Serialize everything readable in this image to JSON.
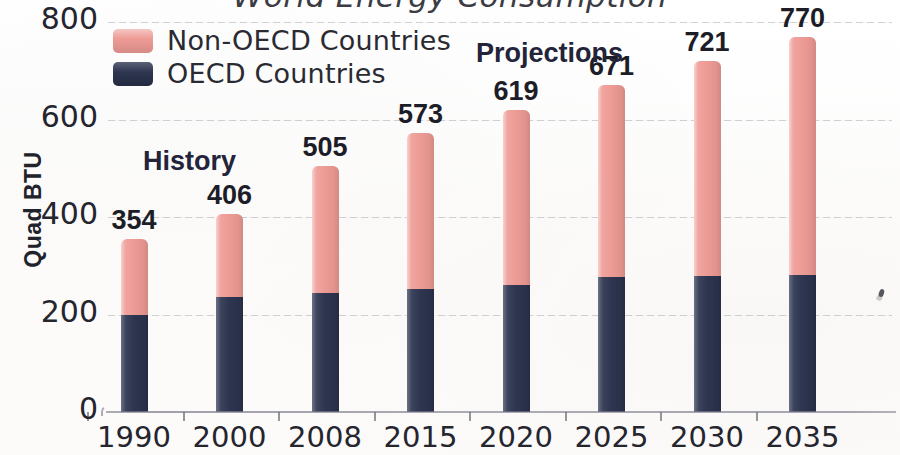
{
  "chart_data": {
    "type": "bar",
    "subtype": "stacked",
    "title": "World Energy Consumption",
    "xlabel": "",
    "ylabel": "Quad BTU",
    "categories": [
      "1990",
      "2000",
      "2008",
      "2015",
      "2020",
      "2025",
      "2030",
      "2035"
    ],
    "series": [
      {
        "name": "OECD Countries",
        "color": "#2d3550",
        "values": [
          198,
          236,
          244,
          252,
          261,
          276,
          280,
          281
        ]
      },
      {
        "name": "Non-OECD Countries",
        "color": "#ee9b95",
        "values": [
          156,
          170,
          261,
          321,
          358,
          395,
          441,
          489
        ]
      }
    ],
    "totals": [
      354,
      406,
      505,
      573,
      619,
      671,
      721,
      770
    ],
    "total_labels": [
      "354",
      "406",
      "505",
      "573",
      "619",
      "671",
      "721",
      "770"
    ],
    "ylim": [
      0,
      800
    ],
    "yticks": [
      0,
      200,
      400,
      600,
      800
    ],
    "ytick_labels": [
      "0",
      "200",
      "400",
      "600",
      "800"
    ],
    "grid": true,
    "legend_position": "top-left",
    "annotations": [
      {
        "text": "History",
        "x_category": "1990"
      },
      {
        "text": "Projections",
        "x_category": "2020"
      }
    ]
  },
  "legend": {
    "items": [
      {
        "label": "Non-OECD Countries",
        "swatch": "pink"
      },
      {
        "label": "OECD Countries",
        "swatch": "navy"
      }
    ]
  },
  "annotations": {
    "history": "History",
    "projections": "Projections"
  },
  "colors": {
    "non_oecd": "#ee9b95",
    "oecd": "#2d3550",
    "text": "#25252e",
    "annotation": "#23233a"
  },
  "icons": {
    "scan-speck": "scan-artifact-icon"
  }
}
